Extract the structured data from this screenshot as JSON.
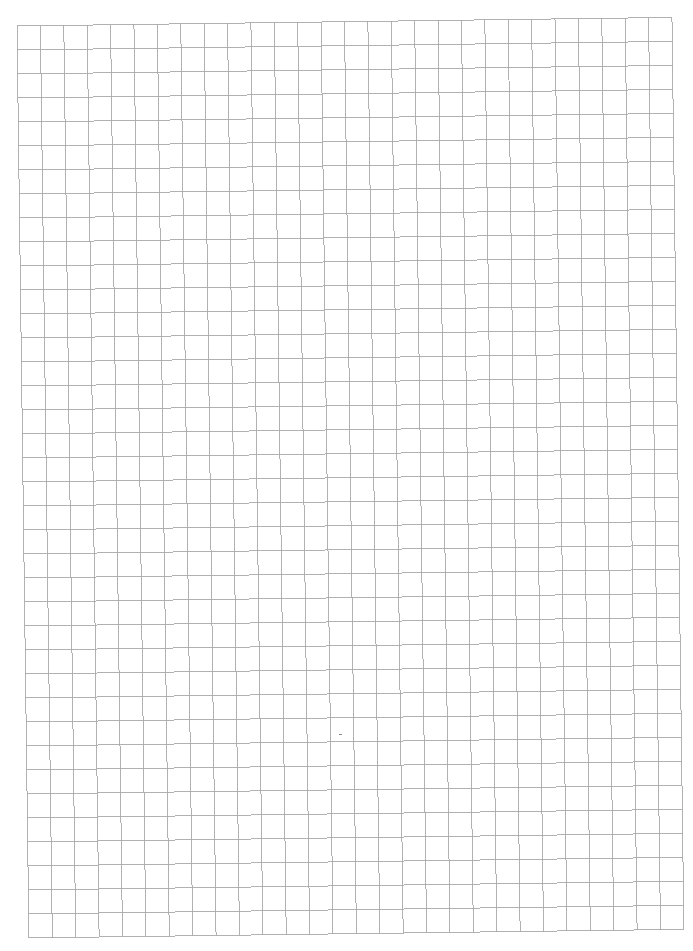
{
  "document": {
    "type": "graph-paper",
    "label": "Blank grid paper page",
    "grid": {
      "columns": 28,
      "rows": 38,
      "line_color": "#a9a9a9",
      "background_color": "#ffffff"
    }
  }
}
